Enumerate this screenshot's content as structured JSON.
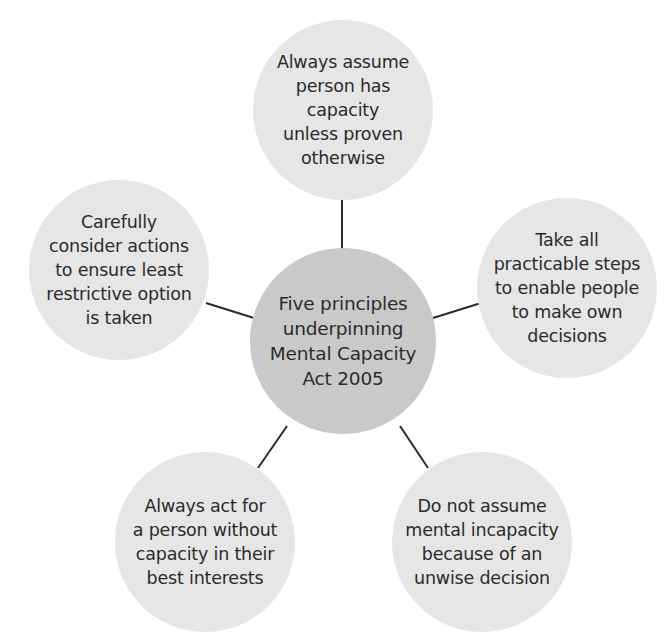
{
  "diagram": {
    "type": "hub-and-spoke",
    "center": {
      "label": "Five principles\nunderpinning\nMental Capacity\nAct 2005"
    },
    "principles": [
      {
        "position": "top",
        "label": "Always assume\nperson has capacity\nunless proven\notherwise"
      },
      {
        "position": "right",
        "label": "Take all\npracticable steps\nto enable people\nto make own\ndecisions"
      },
      {
        "position": "bottom-right",
        "label": "Do not assume\nmental incapacity\nbecause of an\nunwise decision"
      },
      {
        "position": "bottom-left",
        "label": "Always act for\na person without\ncapacity in their\nbest interests"
      },
      {
        "position": "left",
        "label": "Carefully\nconsider actions\nto ensure least\nrestrictive option\nis taken"
      }
    ],
    "colors": {
      "background": "#ffffff",
      "center_fill": "#c9c9c9",
      "outer_fill": "#e6e6e6",
      "connector": "#2b2b2b",
      "text": "#2b2b2b"
    }
  }
}
